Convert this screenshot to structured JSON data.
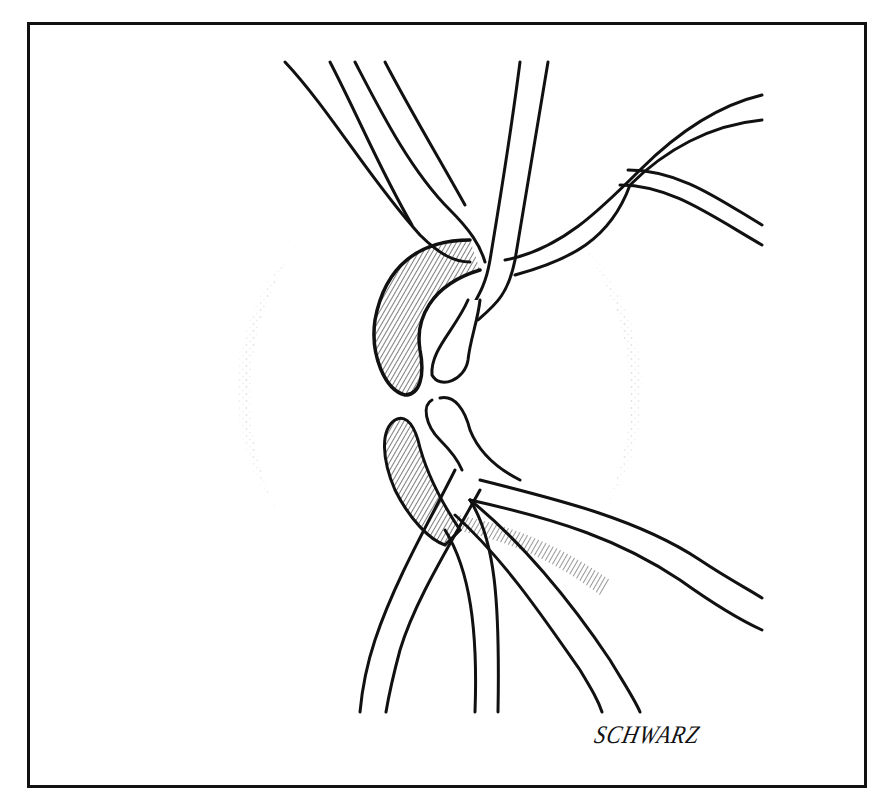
{
  "illustration": {
    "subject": "optic-disc-with-retinal-vessels",
    "signature": "SCHWARZ",
    "colors": {
      "ink": "#111111",
      "paper": "#ffffff"
    }
  }
}
